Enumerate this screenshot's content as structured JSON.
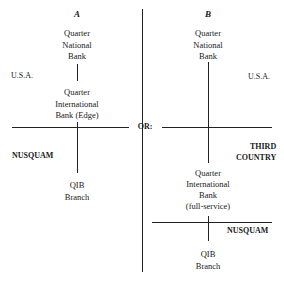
{
  "diagram": {
    "separator_label": "OR:",
    "option_a": {
      "header": "A",
      "top_entity": [
        "Quarter",
        "National",
        "Bank"
      ],
      "top_region": "U.S.A.",
      "middle_entity": [
        "Quarter",
        "International",
        "Bank (Edge)"
      ],
      "bottom_region": "NUSQUAM",
      "bottom_entity": [
        "QIB",
        "Branch"
      ]
    },
    "option_b": {
      "header": "B",
      "top_entity": [
        "Quarter",
        "National",
        "Bank"
      ],
      "top_region": "U.S.A.",
      "middle_region": [
        "THIRD",
        "COUNTRY"
      ],
      "middle_entity": [
        "Quarter",
        "International",
        "Bank",
        "(full-service)"
      ],
      "bottom_region": "NUSQUAM",
      "bottom_entity": [
        "QIB",
        "Branch"
      ]
    }
  }
}
